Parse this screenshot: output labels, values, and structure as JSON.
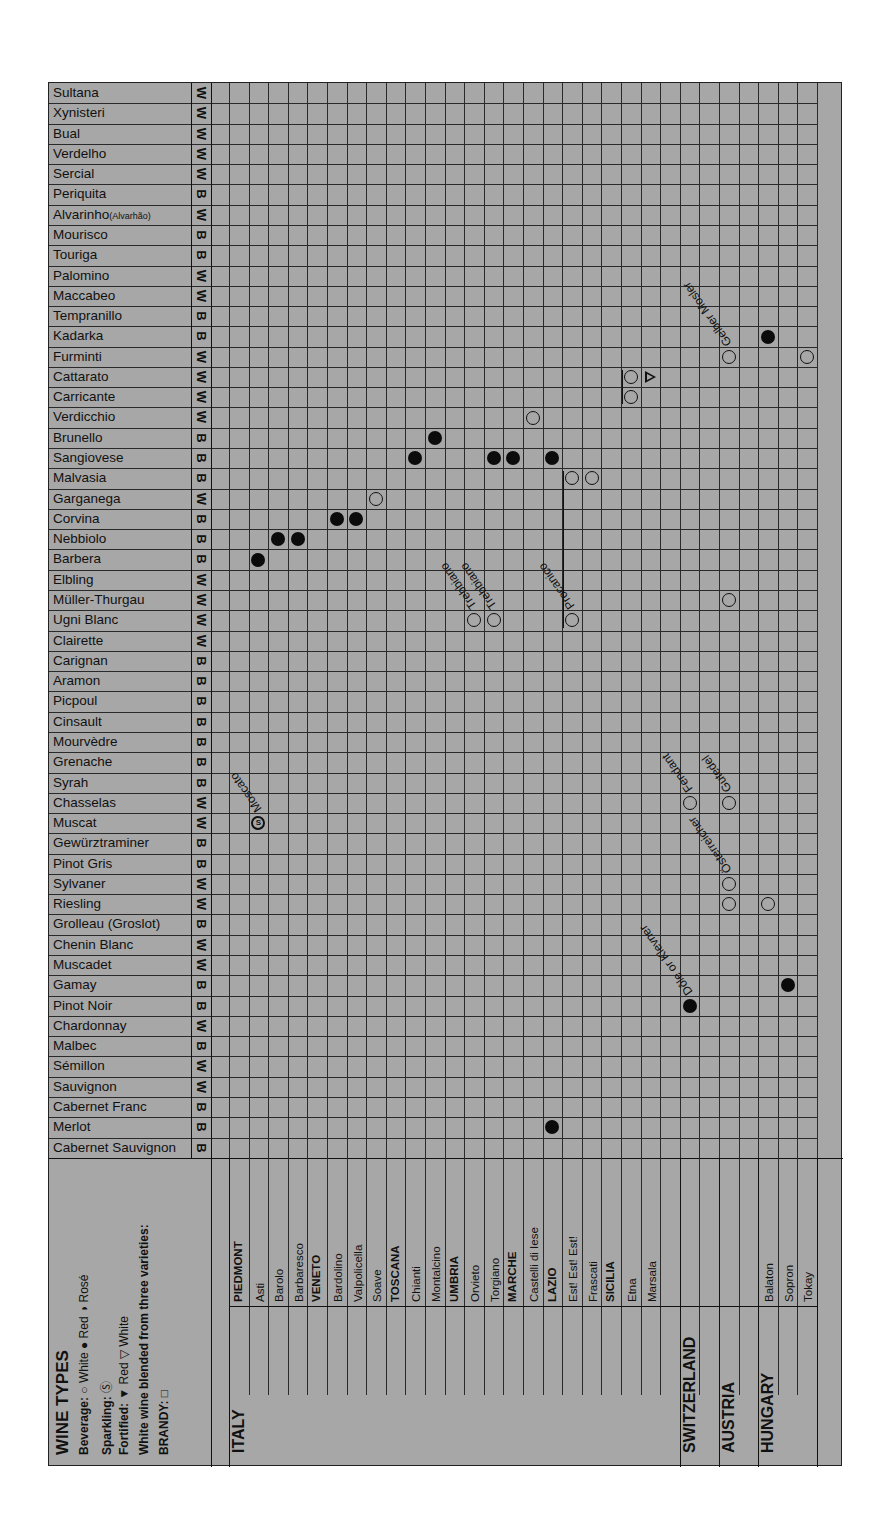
{
  "chart_data": {
    "type": "table",
    "title": "WINE TYPES",
    "legend": {
      "title": "WINE TYPES",
      "beverage": {
        "label": "Beverage:",
        "entries": [
          "White",
          "Red",
          "Rosé"
        ]
      },
      "sparkling": {
        "label": "Sparkling:",
        "symbol": "S"
      },
      "fortified": {
        "label": "Fortified:",
        "entries": [
          "Red",
          "White"
        ]
      },
      "blended": {
        "label": "White wine blended from three varieties:"
      },
      "brandy": {
        "label": "BRANDY:"
      }
    },
    "grapes": [
      {
        "name": "Sultana",
        "type": "W"
      },
      {
        "name": "Xynisteri",
        "type": "W"
      },
      {
        "name": "Bual",
        "type": "W"
      },
      {
        "name": "Verdelho",
        "type": "W"
      },
      {
        "name": "Sercial",
        "type": "W"
      },
      {
        "name": "Periquita",
        "type": "B"
      },
      {
        "name": "Alvarinho",
        "alt": "(Alvarhão)",
        "type": "W"
      },
      {
        "name": "Mourisco",
        "type": "B"
      },
      {
        "name": "Touriga",
        "type": "B"
      },
      {
        "name": "Palomino",
        "type": "W"
      },
      {
        "name": "Maccabeo",
        "type": "W"
      },
      {
        "name": "Tempranillo",
        "type": "B"
      },
      {
        "name": "Kadarka",
        "type": "B"
      },
      {
        "name": "Furminti",
        "type": "W"
      },
      {
        "name": "Cattarato",
        "type": "W"
      },
      {
        "name": "Carricante",
        "type": "W"
      },
      {
        "name": "Verdicchio",
        "type": "W"
      },
      {
        "name": "Brunello",
        "type": "B"
      },
      {
        "name": "Sangiovese",
        "type": "B"
      },
      {
        "name": "Malvasia",
        "type": "B"
      },
      {
        "name": "Garganega",
        "type": "W"
      },
      {
        "name": "Corvina",
        "type": "B"
      },
      {
        "name": "Nebbiolo",
        "type": "B"
      },
      {
        "name": "Barbera",
        "type": "B"
      },
      {
        "name": "Elbling",
        "type": "W"
      },
      {
        "name": "Müller-Thurgau",
        "type": "W"
      },
      {
        "name": "Ugni Blanc",
        "type": "W"
      },
      {
        "name": "Clairette",
        "type": "W"
      },
      {
        "name": "Carignan",
        "type": "B"
      },
      {
        "name": "Aramon",
        "type": "B"
      },
      {
        "name": "Picpoul",
        "type": "B"
      },
      {
        "name": "Cinsault",
        "type": "B"
      },
      {
        "name": "Mourvèdre",
        "type": "B"
      },
      {
        "name": "Grenache",
        "type": "B"
      },
      {
        "name": "Syrah",
        "type": "B"
      },
      {
        "name": "Chasselas",
        "type": "W"
      },
      {
        "name": "Muscat",
        "type": "W"
      },
      {
        "name": "Gewürztraminer",
        "type": "B"
      },
      {
        "name": "Pinot Gris",
        "type": "B"
      },
      {
        "name": "Sylvaner",
        "type": "W"
      },
      {
        "name": "Riesling",
        "type": "W"
      },
      {
        "name": "Grolleau (Groslot)",
        "type": "B"
      },
      {
        "name": "Chenin Blanc",
        "type": "W"
      },
      {
        "name": "Muscadet",
        "type": "W"
      },
      {
        "name": "Gamay",
        "type": "B"
      },
      {
        "name": "Pinot Noir",
        "type": "B"
      },
      {
        "name": "Chardonnay",
        "type": "W"
      },
      {
        "name": "Malbec",
        "type": "B"
      },
      {
        "name": "Sémillon",
        "type": "W"
      },
      {
        "name": "Sauvignon",
        "type": "W"
      },
      {
        "name": "Cabernet Franc",
        "type": "B"
      },
      {
        "name": "Merlot",
        "type": "B"
      },
      {
        "name": "Cabernet Sauvignon",
        "type": "B"
      }
    ],
    "columns": [
      {
        "label": "PIEDMONT",
        "kind": "region",
        "country": "ITALY"
      },
      {
        "label": "Asti",
        "kind": "place"
      },
      {
        "label": "Barolo",
        "kind": "place"
      },
      {
        "label": "Barbaresco",
        "kind": "place"
      },
      {
        "label": "VENETO",
        "kind": "region"
      },
      {
        "label": "Bardolino",
        "kind": "place"
      },
      {
        "label": "Valpolicella",
        "kind": "place"
      },
      {
        "label": "Soave",
        "kind": "place"
      },
      {
        "label": "TOSCANA",
        "kind": "region"
      },
      {
        "label": "Chianti",
        "kind": "place"
      },
      {
        "label": "Montalcino",
        "kind": "place"
      },
      {
        "label": "UMBRIA",
        "kind": "region"
      },
      {
        "label": "Orvieto",
        "kind": "place"
      },
      {
        "label": "Torgiano",
        "kind": "place"
      },
      {
        "label": "MARCHE",
        "kind": "region"
      },
      {
        "label": "Castelli di Iese",
        "kind": "place"
      },
      {
        "label": "LAZIO",
        "kind": "region"
      },
      {
        "label": "Est! Est! Est!",
        "kind": "place"
      },
      {
        "label": "Frascati",
        "kind": "place"
      },
      {
        "label": "SICILIA",
        "kind": "region"
      },
      {
        "label": "Etna",
        "kind": "place"
      },
      {
        "label": "Marsala",
        "kind": "place"
      },
      {
        "label": "",
        "kind": "blank"
      },
      {
        "label": "",
        "kind": "blank",
        "country": "SWITZERLAND"
      },
      {
        "label": "",
        "kind": "blank"
      },
      {
        "label": "",
        "kind": "blank",
        "country": "AUSTRIA"
      },
      {
        "label": "",
        "kind": "blank"
      },
      {
        "label": "Balaton",
        "kind": "place",
        "country": "HUNGARY"
      },
      {
        "label": "Sopron",
        "kind": "place"
      },
      {
        "label": "Tokay",
        "kind": "place"
      }
    ],
    "countries": [
      "ITALY",
      "SWITZERLAND",
      "AUSTRIA",
      "HUNGARY"
    ],
    "markers": [
      {
        "grape": "Muscat",
        "col": 1,
        "symbol": "sparkling"
      },
      {
        "grape": "Barbera",
        "col": 1,
        "symbol": "red"
      },
      {
        "grape": "Nebbiolo",
        "col": 2,
        "symbol": "red"
      },
      {
        "grape": "Nebbiolo",
        "col": 3,
        "symbol": "red"
      },
      {
        "grape": "Corvina",
        "col": 5,
        "symbol": "red"
      },
      {
        "grape": "Corvina",
        "col": 6,
        "symbol": "red"
      },
      {
        "grape": "Garganega",
        "col": 7,
        "symbol": "white"
      },
      {
        "grape": "Sangiovese",
        "col": 9,
        "symbol": "red"
      },
      {
        "grape": "Brunello",
        "col": 10,
        "symbol": "red"
      },
      {
        "grape": "Ugni Blanc",
        "col": 12,
        "symbol": "white"
      },
      {
        "grape": "Sangiovese",
        "col": 13,
        "symbol": "red"
      },
      {
        "grape": "Ugni Blanc",
        "col": 13,
        "symbol": "white"
      },
      {
        "grape": "Sangiovese",
        "col": 14,
        "symbol": "red"
      },
      {
        "grape": "Verdicchio",
        "col": 15,
        "symbol": "white"
      },
      {
        "grape": "Sangiovese",
        "col": 16,
        "symbol": "red"
      },
      {
        "grape": "Merlot",
        "col": 16,
        "symbol": "red"
      },
      {
        "grape": "Malvasia",
        "col": 17,
        "symbol": "white"
      },
      {
        "grape": "Ugni Blanc",
        "col": 17,
        "symbol": "white"
      },
      {
        "grape": "Malvasia",
        "col": 18,
        "symbol": "white"
      },
      {
        "grape": "Cattarato",
        "col": 20,
        "symbol": "white"
      },
      {
        "grape": "Carricante",
        "col": 20,
        "symbol": "white"
      },
      {
        "grape": "Cattarato",
        "col": 21,
        "symbol": "fortified-white"
      },
      {
        "grape": "Chasselas",
        "col": 23,
        "symbol": "white"
      },
      {
        "grape": "Pinot Noir",
        "col": 23,
        "symbol": "red"
      },
      {
        "grape": "Furminti",
        "col": 25,
        "symbol": "white"
      },
      {
        "grape": "Müller-Thurgau",
        "col": 25,
        "symbol": "white"
      },
      {
        "grape": "Chasselas",
        "col": 25,
        "symbol": "white"
      },
      {
        "grape": "Sylvaner",
        "col": 25,
        "symbol": "white"
      },
      {
        "grape": "Riesling",
        "col": 25,
        "symbol": "white"
      },
      {
        "grape": "Kadarka",
        "col": 27,
        "symbol": "red"
      },
      {
        "grape": "Riesling",
        "col": 27,
        "symbol": "white"
      },
      {
        "grape": "Gamay",
        "col": 28,
        "symbol": "red"
      },
      {
        "grape": "Furminti",
        "col": 29,
        "symbol": "white"
      }
    ],
    "annotations": [
      "Moscato",
      "Trebbiano",
      "Trebbiano",
      "Procanico",
      "Gelber Mosler",
      "Gutedel",
      "Fendant",
      "Österreicher",
      "Dôle or Klevner"
    ]
  }
}
